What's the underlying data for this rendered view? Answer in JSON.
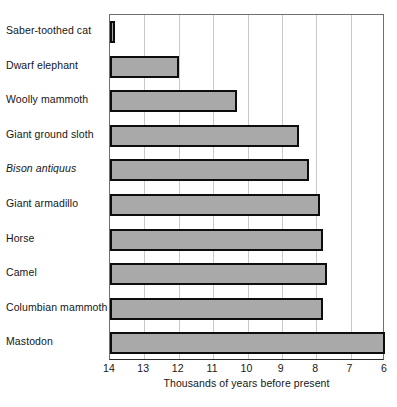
{
  "chart_data": {
    "type": "bar",
    "orientation": "horizontal",
    "title": "",
    "xlabel": "Thousands of years before present",
    "ylabel": "",
    "xlim": [
      14,
      6
    ],
    "x_axis_reversed": true,
    "xticks": [
      14,
      13,
      12,
      11,
      10,
      9,
      8,
      7,
      6
    ],
    "grid": "vertical",
    "legend": "none",
    "categories": [
      "Saber-toothed cat",
      "Dwarf elephant",
      "Woolly mammoth",
      "Giant ground sloth",
      "Bison antiquus",
      "Giant armadillo",
      "Horse",
      "Camel",
      "Columbian mammoth",
      "Mastodon"
    ],
    "values": [
      13.9,
      12.0,
      10.3,
      8.5,
      8.2,
      7.9,
      7.8,
      7.7,
      7.8,
      6.0
    ],
    "bar_fill_color": "#a9a9a9",
    "bar_border_color": "#0d0d0d",
    "gridline_color": "#c9c9c9",
    "axis_color": "#6f6f6f"
  },
  "labels": {
    "items": [
      {
        "text": "Saber-toothed cat",
        "italic": false
      },
      {
        "text": "Dwarf elephant",
        "italic": false
      },
      {
        "text": "Woolly mammoth",
        "italic": false
      },
      {
        "text": "Giant ground sloth",
        "italic": false
      },
      {
        "text": "Bison antiquus",
        "italic": true
      },
      {
        "text": "Giant armadillo",
        "italic": false
      },
      {
        "text": "Horse",
        "italic": false
      },
      {
        "text": "Camel",
        "italic": false
      },
      {
        "text": "Columbian mammoth",
        "italic": false
      },
      {
        "text": "Mastodon",
        "italic": false
      }
    ]
  },
  "axis": {
    "title": "Thousands of years before present",
    "tick_labels": [
      "14",
      "13",
      "12",
      "11",
      "10",
      "9",
      "8",
      "7",
      "6"
    ]
  }
}
